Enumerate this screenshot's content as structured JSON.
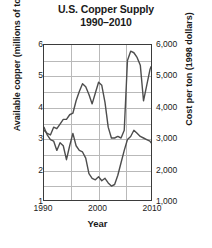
{
  "chart_data": {
    "type": "line",
    "title": "U.S. Copper Supply",
    "subtitle": "1990–2010",
    "xlabel": "Year",
    "ylabel": "Available copper (millions of tons)",
    "y2label": "Cost per ton (1998 dollars)",
    "xlim": [
      1990,
      2010
    ],
    "ylim": [
      1,
      6
    ],
    "y2lim": [
      1000,
      6000
    ],
    "grid": true,
    "legend": "none",
    "xticks": [
      "1990",
      "2000",
      "2010"
    ],
    "xtick_values": [
      1990,
      2000,
      2010
    ],
    "yticks_left": [
      "6",
      "5",
      "4",
      "3",
      "2",
      "1"
    ],
    "ytick_left_values": [
      6,
      5,
      4,
      3,
      2,
      1
    ],
    "yticks_right": [
      "6,000",
      "5,000",
      "4,000",
      "3,000",
      "2,000",
      "1,000"
    ],
    "ytick_right_values": [
      6000,
      5000,
      4000,
      3000,
      2000,
      1000
    ],
    "gridlines_minor_y": [
      1.5,
      2.5,
      3.5,
      4.5,
      5.5
    ],
    "gridlines_x": [
      1995,
      2000,
      2005
    ],
    "series": [
      {
        "name": "Cost per ton (1998 dollars)",
        "axis": "right",
        "color": "#4d4d4d",
        "x": [
          1990,
          1990.6,
          1991.2,
          1991.8,
          1992.4,
          1993,
          1993.6,
          1994.2,
          1994.8,
          1995.4,
          1996,
          1996.6,
          1997.2,
          1997.8,
          1998.4,
          1999,
          1999.6,
          2000.2,
          2000.8,
          2001.4,
          2002,
          2002.6,
          2003.2,
          2003.8,
          2004.4,
          2005,
          2005.6,
          2006.2,
          2006.8,
          2007.4,
          2008,
          2008.6,
          2009.2,
          2009.8,
          2010
        ],
        "values": [
          3250,
          3150,
          3100,
          3350,
          3300,
          3450,
          3600,
          3600,
          3750,
          3800,
          4200,
          4500,
          4750,
          4650,
          4400,
          4100,
          4450,
          4800,
          4700,
          4150,
          3350,
          3000,
          3000,
          3050,
          3000,
          3250,
          5500,
          5800,
          5750,
          5600,
          5350,
          4200,
          4700,
          5200,
          5300
        ]
      },
      {
        "name": "Available copper (millions of tons)",
        "axis": "left",
        "color": "#4d4d4d",
        "x": [
          1990,
          1990.6,
          1991.2,
          1991.8,
          1992.4,
          1993,
          1993.6,
          1994.2,
          1994.8,
          1995.4,
          1996,
          1996.6,
          1997.2,
          1997.8,
          1998.4,
          1999,
          1999.6,
          2000.2,
          2000.8,
          2001.4,
          2002,
          2002.6,
          2003.2,
          2003.8,
          2004.4,
          2005,
          2005.6,
          2006.2,
          2006.8,
          2007.4,
          2008,
          2008.6,
          2009.2,
          2009.8,
          2010
        ],
        "values": [
          3.35,
          3.1,
          2.95,
          2.9,
          2.6,
          2.85,
          2.75,
          2.3,
          2.75,
          3.15,
          2.75,
          2.6,
          2.55,
          2.35,
          1.85,
          1.7,
          1.65,
          1.75,
          1.62,
          1.7,
          1.55,
          1.45,
          1.5,
          1.8,
          2.2,
          2.6,
          2.95,
          3.05,
          3.25,
          3.15,
          3.05,
          3.0,
          2.95,
          2.9,
          2.85
        ]
      }
    ]
  }
}
